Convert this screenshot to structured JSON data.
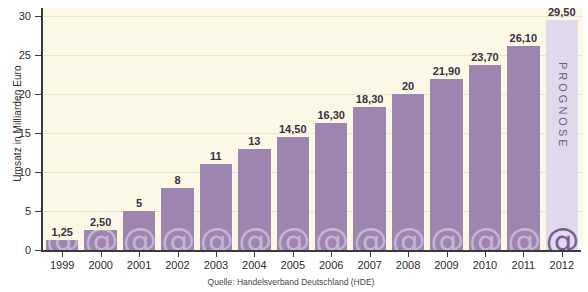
{
  "chart_data": {
    "type": "bar",
    "title": "",
    "xlabel": "",
    "ylabel": "Umsatz in Milliarden Euro",
    "ylim": [
      0,
      31
    ],
    "grid": true,
    "legend": null,
    "y_ticks": [
      0,
      5,
      10,
      15,
      20,
      25,
      30
    ],
    "y_tick_labels": [
      "0",
      "5",
      "10",
      "15",
      "20",
      "25",
      "30"
    ],
    "categories": [
      "1999",
      "2000",
      "2001",
      "2002",
      "2003",
      "2004",
      "2005",
      "2006",
      "2007",
      "2008",
      "2009",
      "2010",
      "2011",
      "2012"
    ],
    "values": [
      1.25,
      2.5,
      5,
      8,
      11,
      13,
      14.5,
      16.3,
      18.3,
      20,
      21.9,
      23.7,
      26.1,
      29.5
    ],
    "value_labels": [
      "1,25",
      "2,50",
      "5",
      "8",
      "11",
      "13",
      "14,50",
      "16,30",
      "18,30",
      "20",
      "21,90",
      "23,70",
      "26,10",
      "29,50"
    ],
    "forecast_index": 13,
    "forecast_label": "PROGNOSE",
    "bar_watermark_glyph": "@",
    "source": "Quelle: Handelsverband Deutschland (HDE)",
    "colors": {
      "bar": "#9d85b0",
      "bar_forecast": "#e1d9ec",
      "watermark": "#c6b4d3",
      "watermark_forecast": "#7b5f93",
      "plot_background": "#fbf8e5",
      "gridline": "#e9e6cf",
      "axis": "#3a3a3a",
      "label_text": "#3b2f45"
    }
  }
}
